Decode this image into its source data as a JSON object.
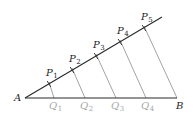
{
  "diagram": {
    "colors": {
      "main_line": "#2a2a2a",
      "parallel_line": "#8c8c8c",
      "label_dark": "#1e1e1e",
      "label_light": "#a8a8a8"
    },
    "points": {
      "A": {
        "label": "A",
        "x": 25,
        "y": 98
      },
      "B": {
        "label": "B",
        "x": 177,
        "y": 98
      },
      "ray_end": {
        "x": 162,
        "y": 17
      }
    },
    "p_points": [
      {
        "label": "P",
        "sub": "1",
        "x": 49,
        "y": 84
      },
      {
        "label": "P",
        "sub": "2",
        "x": 72,
        "y": 70
      },
      {
        "label": "P",
        "sub": "3",
        "x": 96,
        "y": 56
      },
      {
        "label": "P",
        "sub": "4",
        "x": 120,
        "y": 42
      },
      {
        "label": "P",
        "sub": "5",
        "x": 144,
        "y": 28
      }
    ],
    "q_points": [
      {
        "label": "Q",
        "sub": "1",
        "x": 54,
        "y": 98
      },
      {
        "label": "Q",
        "sub": "2",
        "x": 85,
        "y": 98
      },
      {
        "label": "Q",
        "sub": "3",
        "x": 116,
        "y": 98
      },
      {
        "label": "Q",
        "sub": "4",
        "x": 146,
        "y": 98
      }
    ]
  }
}
